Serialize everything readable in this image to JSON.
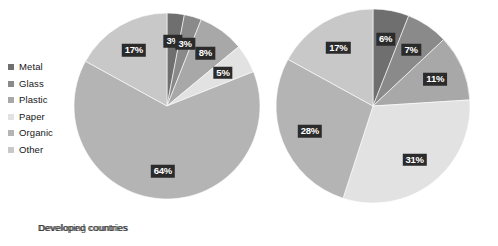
{
  "chart_data": {
    "type": "pie",
    "title": "",
    "legend_position": "left",
    "categories": [
      "Metal",
      "Glass",
      "Plastic",
      "Paper",
      "Organic",
      "Other"
    ],
    "colors": [
      "#6f6f6f",
      "#8a8a8a",
      "#a8a8a8",
      "#e2e2e2",
      "#b4b4b4",
      "#c8c8c8"
    ],
    "charts": [
      {
        "name": "developing",
        "caption": "Developing countries",
        "values": [
          3,
          3,
          8,
          5,
          64,
          17
        ],
        "labels": [
          "3%",
          "3%",
          "8%",
          "5%",
          "64%",
          "17%"
        ]
      },
      {
        "name": "developed",
        "caption": "Developed countries",
        "values": [
          6,
          7,
          11,
          31,
          28,
          17
        ],
        "labels": [
          "6%",
          "7%",
          "11%",
          "31%",
          "28%",
          "17%"
        ]
      }
    ]
  },
  "legend": {
    "items": [
      {
        "label": "Metal",
        "color": "#6f6f6f"
      },
      {
        "label": "Glass",
        "color": "#8a8a8a"
      },
      {
        "label": "Plastic",
        "color": "#a8a8a8"
      },
      {
        "label": "Paper",
        "color": "#e2e2e2"
      },
      {
        "label": "Organic",
        "color": "#b4b4b4"
      },
      {
        "label": "Other",
        "color": "#c8c8c8"
      }
    ]
  },
  "panels": {
    "developing": {
      "caption": "Developing countries"
    },
    "developed": {
      "caption": "Developed countries"
    }
  }
}
